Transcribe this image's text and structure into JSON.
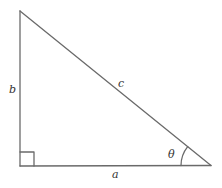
{
  "diagram": {
    "type": "right-triangle",
    "colors": {
      "stroke": "#6a6a6a",
      "label": "#333333",
      "background": "#ffffff"
    },
    "vertices": {
      "top": [
        20,
        11
      ],
      "right_angle": [
        20,
        166
      ],
      "acute": [
        211,
        165
      ]
    },
    "labels": {
      "vertical_leg": "b",
      "hypotenuse": "c",
      "horizontal_leg": "a",
      "angle": "θ"
    },
    "right_angle_marker": true,
    "angle_marker": "arc"
  }
}
